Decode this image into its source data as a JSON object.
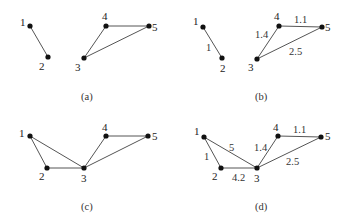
{
  "figure": {
    "panels": [
      {
        "id": "a",
        "caption": "(a)",
        "nodes": [
          {
            "id": "1",
            "x": 30,
            "y": 26
          },
          {
            "id": "2",
            "x": 48,
            "y": 57
          },
          {
            "id": "3",
            "x": 84,
            "y": 58
          },
          {
            "id": "4",
            "x": 106,
            "y": 26
          },
          {
            "id": "5",
            "x": 149,
            "y": 26
          }
        ],
        "edges": [
          {
            "from": "1",
            "to": "2",
            "weight": ""
          },
          {
            "from": "3",
            "to": "4",
            "weight": ""
          },
          {
            "from": "4",
            "to": "5",
            "weight": ""
          },
          {
            "from": "3",
            "to": "5",
            "weight": ""
          }
        ]
      },
      {
        "id": "b",
        "caption": "(b)",
        "nodes": [
          {
            "id": "1",
            "x": 203,
            "y": 27
          },
          {
            "id": "2",
            "x": 222,
            "y": 58
          },
          {
            "id": "3",
            "x": 257,
            "y": 59
          },
          {
            "id": "4",
            "x": 279,
            "y": 26
          },
          {
            "id": "5",
            "x": 322,
            "y": 27
          }
        ],
        "edges": [
          {
            "from": "1",
            "to": "2",
            "weight": "1"
          },
          {
            "from": "3",
            "to": "4",
            "weight": "1.4"
          },
          {
            "from": "4",
            "to": "5",
            "weight": "1.1"
          },
          {
            "from": "3",
            "to": "5",
            "weight": "2.5"
          }
        ]
      },
      {
        "id": "c",
        "caption": "(c)",
        "nodes": [
          {
            "id": "1",
            "x": 30,
            "y": 136
          },
          {
            "id": "2",
            "x": 47,
            "y": 168
          },
          {
            "id": "3",
            "x": 84,
            "y": 168
          },
          {
            "id": "4",
            "x": 106,
            "y": 136
          },
          {
            "id": "5",
            "x": 148,
            "y": 136
          }
        ],
        "edges": [
          {
            "from": "1",
            "to": "2",
            "weight": ""
          },
          {
            "from": "1",
            "to": "3",
            "weight": ""
          },
          {
            "from": "2",
            "to": "3",
            "weight": ""
          },
          {
            "from": "3",
            "to": "4",
            "weight": ""
          },
          {
            "from": "4",
            "to": "5",
            "weight": ""
          },
          {
            "from": "3",
            "to": "5",
            "weight": ""
          }
        ]
      },
      {
        "id": "d",
        "caption": "(d)",
        "nodes": [
          {
            "id": "1",
            "x": 204,
            "y": 137
          },
          {
            "id": "2",
            "x": 221,
            "y": 168
          },
          {
            "id": "3",
            "x": 257,
            "y": 168
          },
          {
            "id": "4",
            "x": 278,
            "y": 136
          },
          {
            "id": "5",
            "x": 321,
            "y": 137
          }
        ],
        "edges": [
          {
            "from": "1",
            "to": "2",
            "weight": "1"
          },
          {
            "from": "1",
            "to": "3",
            "weight": "5"
          },
          {
            "from": "2",
            "to": "3",
            "weight": "4.2"
          },
          {
            "from": "3",
            "to": "4",
            "weight": "1.4"
          },
          {
            "from": "4",
            "to": "5",
            "weight": "1.1"
          },
          {
            "from": "3",
            "to": "5",
            "weight": "2.5"
          }
        ]
      }
    ]
  },
  "labels": {
    "a": {
      "n1": "1",
      "n2": "2",
      "n3": "3",
      "n4": "4",
      "n5": "5",
      "caption": "(a)"
    },
    "b": {
      "n1": "1",
      "n2": "2",
      "n3": "3",
      "n4": "4",
      "n5": "5",
      "w12": "1",
      "w34": "1.4",
      "w45": "1.1",
      "w35": "2.5",
      "caption": "(b)"
    },
    "c": {
      "n1": "1",
      "n2": "2",
      "n3": "3",
      "n4": "4",
      "n5": "5",
      "caption": "(c)"
    },
    "d": {
      "n1": "1",
      "n2": "2",
      "n3": "3",
      "n4": "4",
      "n5": "5",
      "w12": "1",
      "w13": "5",
      "w23": "4.2",
      "w34": "1.4",
      "w45": "1.1",
      "w35": "2.5",
      "caption": "(d)"
    }
  }
}
